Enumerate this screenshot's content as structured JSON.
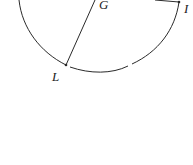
{
  "diagram": {
    "type": "circle-geometry",
    "points": [
      {
        "name": "G",
        "label": "G"
      },
      {
        "name": "I",
        "label": "I"
      },
      {
        "name": "L",
        "label": "L"
      }
    ],
    "segments": [
      {
        "from": "G",
        "to": "L"
      },
      {
        "from": "G",
        "to": "I"
      }
    ],
    "colors": {
      "stroke": "#2a2a2a",
      "background": "#ffffff"
    }
  }
}
